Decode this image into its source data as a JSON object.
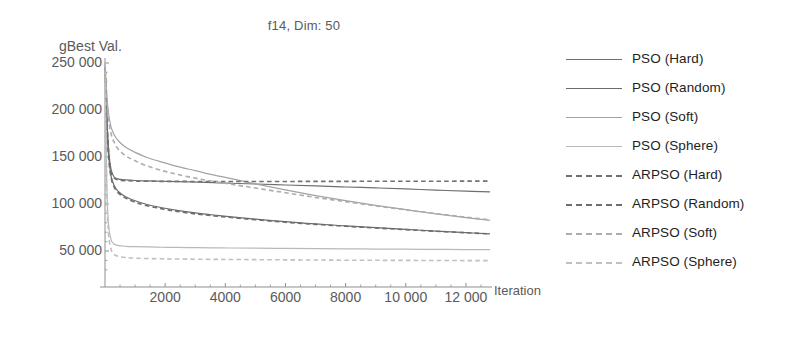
{
  "chart_data": {
    "type": "line",
    "title": "f14, Dim: 50",
    "xlabel": "Iteration",
    "ylabel": "gBest Val.",
    "xlim": [
      0,
      12800
    ],
    "ylim": [
      25000,
      250000
    ],
    "xticks": [
      2000,
      4000,
      6000,
      8000,
      10000,
      12000
    ],
    "xtick_labels": [
      "2000",
      "4000",
      "6000",
      "8000",
      "10 000",
      "12 000"
    ],
    "yticks": [
      50000,
      100000,
      150000,
      200000,
      250000
    ],
    "ytick_labels": [
      "50 000",
      "100 000",
      "150 000",
      "200 000",
      "250 000"
    ],
    "grid": false,
    "legend_position": "right",
    "x": [
      0,
      60,
      120,
      200,
      300,
      450,
      700,
      1000,
      1400,
      1900,
      2400,
      3000,
      3600,
      4200,
      5000,
      6000,
      7000,
      8000,
      9000,
      10000,
      11000,
      12000,
      12800
    ],
    "series": [
      {
        "name": "PSO (Hard)",
        "style": "solid",
        "color": "#6f6f6f",
        "values": [
          250000,
          196000,
          158000,
          137000,
          129000,
          126500,
          125600,
          125000,
          124600,
          124200,
          123800,
          123300,
          122700,
          122100,
          121300,
          120200,
          119200,
          118100,
          117100,
          116000,
          114800,
          113600,
          112800
        ]
      },
      {
        "name": "PSO (Random)",
        "style": "solid",
        "color": "#6b6b6b",
        "values": [
          250000,
          188000,
          152000,
          130000,
          120000,
          113000,
          107500,
          103500,
          99500,
          96000,
          93200,
          90500,
          88300,
          86400,
          84000,
          81200,
          78800,
          76700,
          74800,
          73000,
          71200,
          69500,
          68200
        ]
      },
      {
        "name": "PSO (Soft)",
        "style": "solid",
        "color": "#a3a3a3",
        "values": [
          250000,
          215000,
          196000,
          182000,
          174000,
          167000,
          160000,
          155000,
          149500,
          144500,
          140000,
          135500,
          131000,
          127000,
          121500,
          115000,
          109000,
          103500,
          98500,
          94000,
          89500,
          85500,
          82500
        ]
      },
      {
        "name": "PSO (Sphere)",
        "style": "solid",
        "color": "#b9b9b9",
        "values": [
          250000,
          120000,
          78000,
          62000,
          57500,
          55800,
          55000,
          54600,
          54300,
          54000,
          53800,
          53600,
          53400,
          53200,
          53000,
          52700,
          52500,
          52300,
          52100,
          51900,
          51700,
          51500,
          51400
        ]
      },
      {
        "name": "ARPSO (Hard)",
        "style": "dashed",
        "color": "#717171",
        "values": [
          250000,
          193000,
          156000,
          135000,
          128000,
          125500,
          124800,
          124400,
          124200,
          124100,
          124050,
          124000,
          124000,
          124000,
          124000,
          124000,
          124050,
          124100,
          124150,
          124200,
          124250,
          124300,
          124350
        ]
      },
      {
        "name": "ARPSO (Random)",
        "style": "dashed",
        "color": "#6d6d6d",
        "values": [
          250000,
          186000,
          150000,
          128500,
          118500,
          111500,
          106000,
          102000,
          98200,
          94800,
          92100,
          89500,
          87400,
          85600,
          83300,
          80600,
          78300,
          76300,
          74500,
          72700,
          71000,
          69400,
          68300
        ]
      },
      {
        "name": "ARPSO (Soft)",
        "style": "dashed",
        "color": "#adadad",
        "values": [
          250000,
          212000,
          190000,
          175000,
          166000,
          158000,
          151000,
          146000,
          140500,
          135500,
          131500,
          127500,
          124000,
          121000,
          117000,
          112000,
          107000,
          102500,
          98000,
          93800,
          89800,
          86000,
          83200
        ]
      },
      {
        "name": "ARPSO (Sphere)",
        "style": "dashed",
        "color": "#c0c0c0",
        "values": [
          250000,
          112000,
          68000,
          52000,
          46500,
          44200,
          43000,
          42400,
          42000,
          41700,
          41500,
          41300,
          41100,
          41000,
          40800,
          40600,
          40400,
          40200,
          40100,
          40000,
          39900,
          39800,
          39700
        ]
      }
    ]
  },
  "axis": {
    "axis_color": "#8f8f8f"
  }
}
